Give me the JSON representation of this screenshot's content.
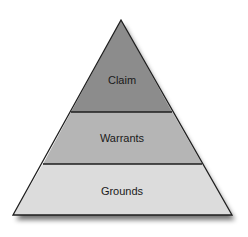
{
  "diagram": {
    "type": "pyramid",
    "levels": [
      {
        "label": "Claim",
        "color": "#8c8c8c",
        "position": "top"
      },
      {
        "label": "Warrants",
        "color": "#b5b5b5",
        "position": "middle"
      },
      {
        "label": "Grounds",
        "color": "#dcdcdc",
        "position": "bottom"
      }
    ],
    "outline_color": "#1e1e1e"
  }
}
